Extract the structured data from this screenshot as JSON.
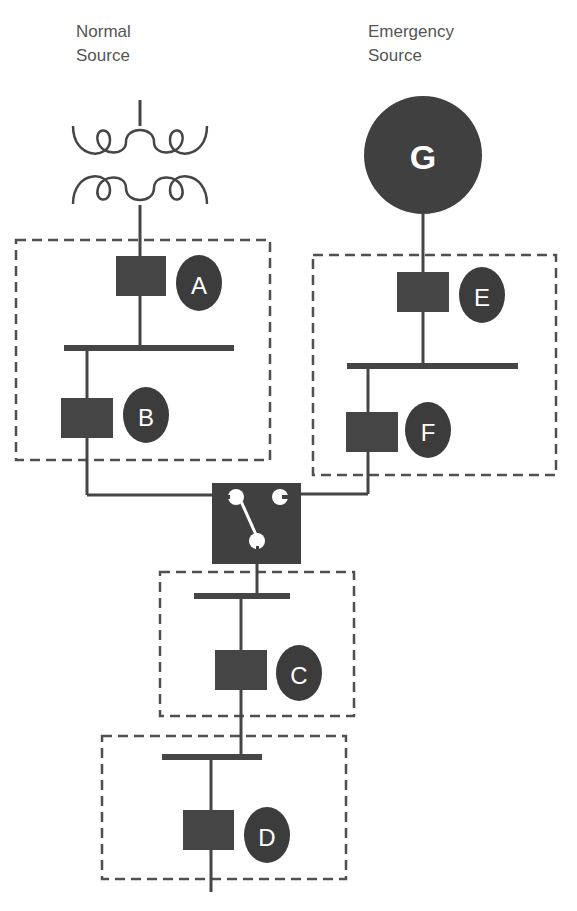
{
  "sources": {
    "normal": {
      "label": "Normal\nSource",
      "symbol": "transformer"
    },
    "emergency": {
      "label": "Emergency\nSource",
      "symbol": "generator",
      "glyph": "G"
    }
  },
  "breakers": [
    {
      "id": "A",
      "label": "A",
      "zone": "normal-source-zone"
    },
    {
      "id": "B",
      "label": "B",
      "zone": "normal-source-zone"
    },
    {
      "id": "E",
      "label": "E",
      "zone": "emergency-source-zone"
    },
    {
      "id": "F",
      "label": "F",
      "zone": "emergency-source-zone"
    },
    {
      "id": "C",
      "label": "C",
      "zone": "downstream-zone-1"
    },
    {
      "id": "D",
      "label": "D",
      "zone": "downstream-zone-2"
    }
  ],
  "transfer_switch": {
    "symbol": "transfer-switch",
    "position": "normal"
  },
  "colors": {
    "equipment": "#454545",
    "badge": "#3c3c3c",
    "label_text": "#555555",
    "background": "#ffffff"
  }
}
